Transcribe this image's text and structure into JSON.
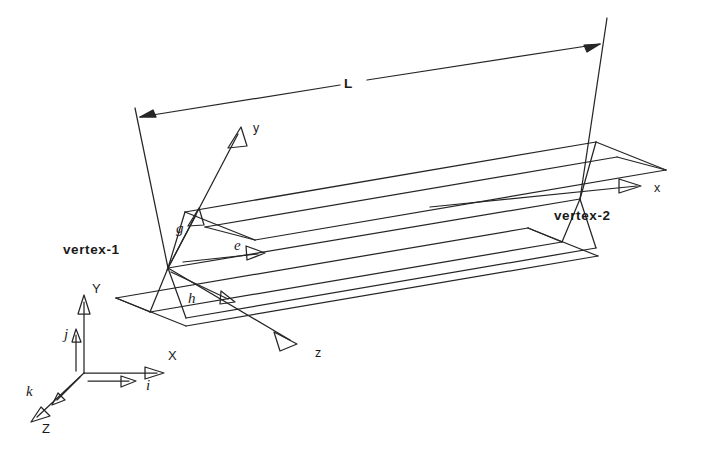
{
  "figure": {
    "background_color": "#ffffff",
    "line_color": "#262626",
    "text_color": "#1a1a1a",
    "width": 710,
    "height": 450
  },
  "dimension": {
    "label": "L",
    "description": "overall beam length between vertex-1 and vertex-2"
  },
  "vertices": {
    "start": {
      "label": "vertex-1"
    },
    "end": {
      "label": "vertex-2"
    }
  },
  "local_axes": [
    {
      "name": "x",
      "label": "x",
      "description": "local beam axis pointing along the member toward vertex-2"
    },
    {
      "name": "y",
      "label": "y",
      "description": "local transverse axis pointing up and to the right"
    },
    {
      "name": "z",
      "label": "z",
      "description": "local transverse axis pointing down and to the right"
    }
  ],
  "local_unit_vectors": [
    {
      "name": "e",
      "label": "e",
      "description": "unit vector along local x axis"
    },
    {
      "name": "g",
      "label": "g",
      "description": "unit vector along local y axis"
    },
    {
      "name": "h",
      "label": "h",
      "description": "unit vector along local z axis"
    }
  ],
  "global_axes": [
    {
      "name": "X",
      "label": "X",
      "description": "global X axis, horizontal to the right"
    },
    {
      "name": "Y",
      "label": "Y",
      "description": "global Y axis, vertical upward"
    },
    {
      "name": "Z",
      "label": "Z",
      "description": "global Z axis, toward lower left"
    }
  ],
  "global_unit_vectors": [
    {
      "name": "i",
      "label": "i",
      "description": "global unit vector along X"
    },
    {
      "name": "j",
      "label": "j",
      "description": "global unit vector along Y"
    },
    {
      "name": "k",
      "label": "k",
      "description": "global unit vector along Z"
    }
  ]
}
